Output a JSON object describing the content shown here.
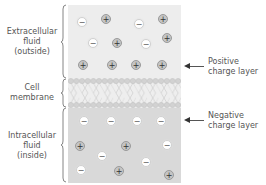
{
  "regions": {
    "extracellular": {
      "label_lines": [
        "Extracellular",
        "fluid",
        "(outside)"
      ]
    },
    "membrane": {
      "label_lines": [
        "Cell",
        "membrane"
      ]
    },
    "intracellular": {
      "label_lines": [
        "Intracellular",
        "fluid",
        "(inside)"
      ]
    }
  },
  "callouts": {
    "positive": {
      "label_lines": [
        "Positive",
        "charge layer"
      ]
    },
    "negative": {
      "label_lines": [
        "Negative",
        "charge layer"
      ]
    }
  },
  "symbols": {
    "plus": "+",
    "minus": "−"
  },
  "colors": {
    "outside_fill": "#ededed",
    "inside_fill": "#d9d9d9",
    "positive_ion": "#c4c4c4",
    "negative_ion": "#ffffff"
  },
  "ions_outside": [
    {
      "type": "minus",
      "x": 82,
      "y": 22
    },
    {
      "type": "plus",
      "x": 106,
      "y": 19
    },
    {
      "type": "minus",
      "x": 139,
      "y": 24
    },
    {
      "type": "plus",
      "x": 163,
      "y": 19
    },
    {
      "type": "minus",
      "x": 93,
      "y": 43
    },
    {
      "type": "plus",
      "x": 117,
      "y": 43
    },
    {
      "type": "minus",
      "x": 146,
      "y": 44
    },
    {
      "type": "plus",
      "x": 167,
      "y": 38
    },
    {
      "type": "plus",
      "x": 83,
      "y": 65
    },
    {
      "type": "plus",
      "x": 112,
      "y": 65
    },
    {
      "type": "plus",
      "x": 136,
      "y": 65
    },
    {
      "type": "plus",
      "x": 162,
      "y": 65
    }
  ],
  "ions_inside": [
    {
      "type": "minus",
      "x": 84,
      "y": 121
    },
    {
      "type": "minus",
      "x": 111,
      "y": 121
    },
    {
      "type": "minus",
      "x": 137,
      "y": 121
    },
    {
      "type": "minus",
      "x": 161,
      "y": 121
    },
    {
      "type": "plus",
      "x": 80,
      "y": 146
    },
    {
      "type": "plus",
      "x": 126,
      "y": 146
    },
    {
      "type": "minus",
      "x": 167,
      "y": 145
    },
    {
      "type": "minus",
      "x": 102,
      "y": 156
    },
    {
      "type": "minus",
      "x": 146,
      "y": 162
    },
    {
      "type": "minus",
      "x": 81,
      "y": 170
    },
    {
      "type": "plus",
      "x": 119,
      "y": 171
    },
    {
      "type": "plus",
      "x": 169,
      "y": 175
    }
  ]
}
